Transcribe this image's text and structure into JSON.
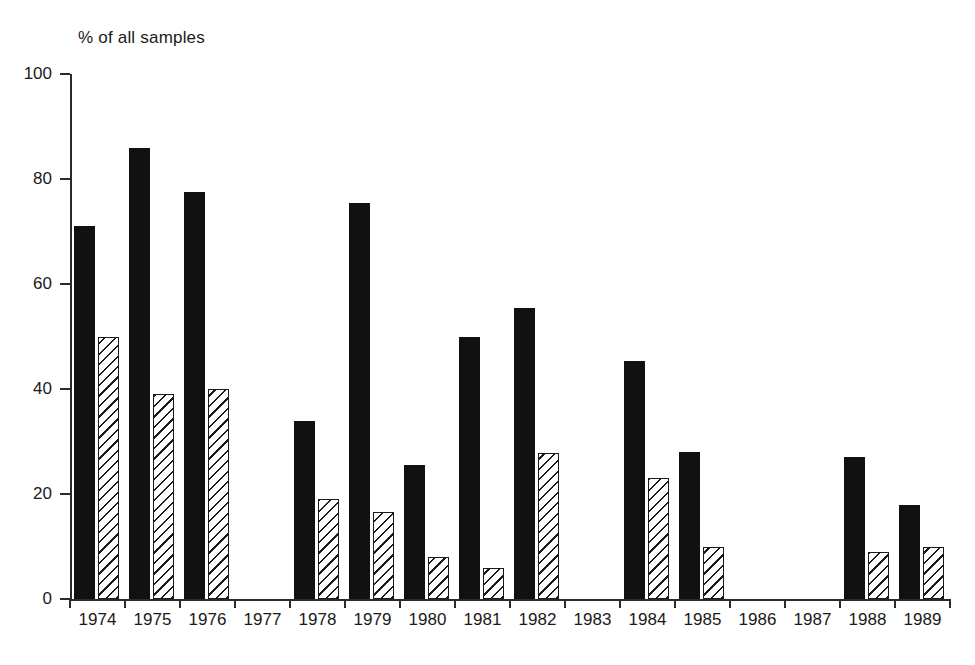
{
  "chart": {
    "axis_title": "% of all samples",
    "xlabel": "",
    "ylabel": "% of all samples"
  },
  "chart_data": {
    "type": "bar",
    "title": "",
    "subtitle": "",
    "xlabel": "",
    "ylabel": "% of all samples",
    "ylim": [
      0,
      100
    ],
    "yticks": [
      0,
      20,
      40,
      60,
      80,
      100
    ],
    "grid": false,
    "legend": null,
    "legend_position": "none",
    "categories": [
      "1974",
      "1975",
      "1976",
      "1977",
      "1978",
      "1979",
      "1980",
      "1981",
      "1982",
      "1983",
      "1984",
      "1985",
      "1986",
      "1987",
      "1988",
      "1989"
    ],
    "series": [
      {
        "name": "solid",
        "style": "solid-black",
        "values": [
          71,
          86,
          77.5,
          null,
          34,
          75.5,
          25.5,
          50,
          55.5,
          null,
          45.3,
          28,
          null,
          null,
          27,
          18
        ]
      },
      {
        "name": "hatched",
        "style": "diagonal-hatch",
        "values": [
          50,
          39,
          40,
          null,
          19,
          16.5,
          8,
          6,
          27.8,
          null,
          23,
          10,
          null,
          null,
          9,
          10
        ]
      }
    ]
  },
  "ytick_labels": [
    "100",
    "80",
    "60",
    "40",
    "20",
    "0"
  ],
  "colors": {
    "solid_bar": "#111111",
    "hatch_line": "#1a1a1a",
    "background": "#ffffff",
    "axis": "#2b2b2b"
  }
}
